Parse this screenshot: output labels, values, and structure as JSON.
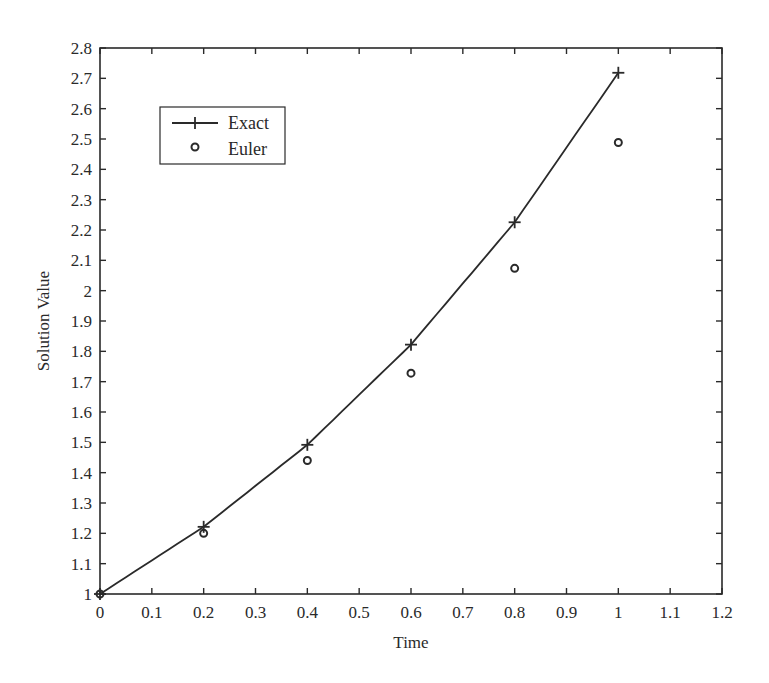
{
  "chart_data": {
    "type": "line",
    "title": "",
    "xlabel": "Time",
    "ylabel": "Solution Value",
    "xlim": [
      0,
      1.2
    ],
    "ylim": [
      1,
      2.8
    ],
    "grid": false,
    "legend_position": "upper-left",
    "x_ticks": [
      "0",
      "0.1",
      "0.2",
      "0.3",
      "0.4",
      "0.5",
      "0.6",
      "0.7",
      "0.8",
      "0.9",
      "1",
      "1.1",
      "1.2"
    ],
    "y_ticks": [
      "1",
      "1.1",
      "1.2",
      "1.3",
      "1.4",
      "1.5",
      "1.6",
      "1.7",
      "1.8",
      "1.9",
      "2",
      "2.1",
      "2.2",
      "2.3",
      "2.4",
      "2.5",
      "2.6",
      "2.7",
      "2.8"
    ],
    "series": [
      {
        "name": "Exact",
        "style": "line with plus markers",
        "x": [
          0,
          0.2,
          0.4,
          0.6,
          0.8,
          1.0
        ],
        "values": [
          1.0,
          1.2214,
          1.4918,
          1.8221,
          2.2255,
          2.7183
        ]
      },
      {
        "name": "Euler",
        "style": "circle markers",
        "x": [
          0,
          0.2,
          0.4,
          0.6,
          0.8,
          1.0
        ],
        "values": [
          1.0,
          1.2,
          1.44,
          1.728,
          2.0736,
          2.4883
        ]
      }
    ]
  },
  "colors": {
    "line": "#2a2a2a",
    "background": "#ffffff"
  }
}
